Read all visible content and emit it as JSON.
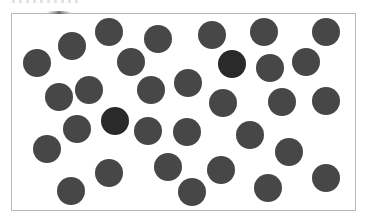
{
  "canvas": {
    "width": 367,
    "height": 224,
    "background": "#ffffff"
  },
  "frame": {
    "x": 11,
    "y": 13,
    "width": 345,
    "height": 198,
    "border_color": "#b8b8b8"
  },
  "dots": {
    "radius": 14,
    "normal_color": "#474747",
    "highlight_color": "#2a2a2a",
    "count": 32,
    "highlighted_count": 2,
    "items": [
      {
        "x": 37,
        "y": 63,
        "highlight": false
      },
      {
        "x": 72,
        "y": 46,
        "highlight": false
      },
      {
        "x": 109,
        "y": 32,
        "highlight": false
      },
      {
        "x": 158,
        "y": 39,
        "highlight": false
      },
      {
        "x": 212,
        "y": 35,
        "highlight": false
      },
      {
        "x": 264,
        "y": 32,
        "highlight": false
      },
      {
        "x": 326,
        "y": 32,
        "highlight": false
      },
      {
        "x": 131,
        "y": 62,
        "highlight": false
      },
      {
        "x": 232,
        "y": 64,
        "highlight": true
      },
      {
        "x": 270,
        "y": 68,
        "highlight": false
      },
      {
        "x": 306,
        "y": 62,
        "highlight": false
      },
      {
        "x": 59,
        "y": 97,
        "highlight": false
      },
      {
        "x": 89,
        "y": 90,
        "highlight": false
      },
      {
        "x": 151,
        "y": 90,
        "highlight": false
      },
      {
        "x": 188,
        "y": 83,
        "highlight": false
      },
      {
        "x": 223,
        "y": 103,
        "highlight": false
      },
      {
        "x": 282,
        "y": 102,
        "highlight": false
      },
      {
        "x": 326,
        "y": 101,
        "highlight": false
      },
      {
        "x": 77,
        "y": 129,
        "highlight": false
      },
      {
        "x": 115,
        "y": 121,
        "highlight": true
      },
      {
        "x": 148,
        "y": 131,
        "highlight": false
      },
      {
        "x": 187,
        "y": 132,
        "highlight": false
      },
      {
        "x": 250,
        "y": 135,
        "highlight": false
      },
      {
        "x": 289,
        "y": 152,
        "highlight": false
      },
      {
        "x": 47,
        "y": 149,
        "highlight": false
      },
      {
        "x": 109,
        "y": 173,
        "highlight": false
      },
      {
        "x": 168,
        "y": 167,
        "highlight": false
      },
      {
        "x": 221,
        "y": 170,
        "highlight": false
      },
      {
        "x": 326,
        "y": 178,
        "highlight": false
      },
      {
        "x": 71,
        "y": 191,
        "highlight": false
      },
      {
        "x": 192,
        "y": 192,
        "highlight": false
      },
      {
        "x": 268,
        "y": 188,
        "highlight": false
      }
    ]
  }
}
